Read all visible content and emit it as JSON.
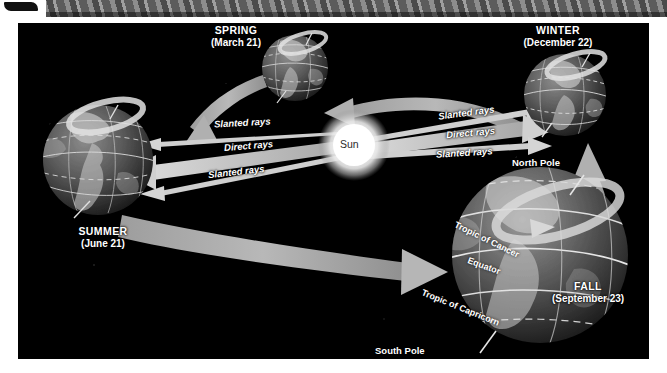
{
  "page": {
    "background": "#000000",
    "accent": "#b9b9b9"
  },
  "banner": {
    "name": "decorative-patterned-banner"
  },
  "sun": {
    "label": "Sun",
    "color": "#ffffff"
  },
  "seasons": [
    {
      "key": "spring",
      "name": "SPRING",
      "date": "(March 21)"
    },
    {
      "key": "winter",
      "name": "WINTER",
      "date": "(December 22)"
    },
    {
      "key": "summer",
      "name": "SUMMER",
      "date": "(June 21)"
    },
    {
      "key": "fall",
      "name": "FALL",
      "date": "(September 23)"
    }
  ],
  "rays": {
    "left": [
      {
        "label": "Slanted rays"
      },
      {
        "label": "Direct rays"
      },
      {
        "label": "Slanted rays"
      }
    ],
    "right": [
      {
        "label": "Slanted rays"
      },
      {
        "label": "Direct rays"
      },
      {
        "label": "Slanted rays"
      }
    ]
  },
  "fall_globe_labels": {
    "north_pole": "North Pole",
    "south_pole": "South Pole",
    "tropic_of_cancer": "Tropic of Cancer",
    "equator": "Equator",
    "tropic_of_capricorn": "Tropic of Capricorn"
  }
}
